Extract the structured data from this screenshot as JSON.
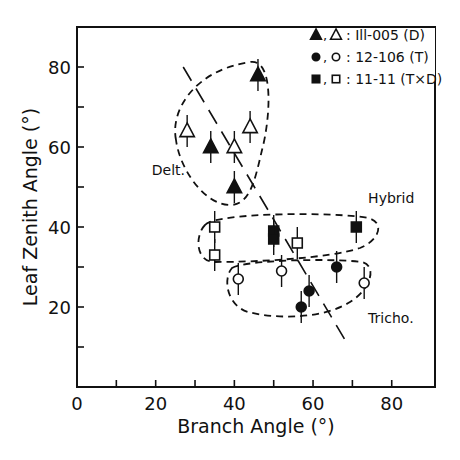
{
  "chart_data": {
    "type": "scatter",
    "title": "",
    "xlabel": "Branch Angle (°)",
    "ylabel": "Leaf Zenith Angle (°)",
    "xlim": [
      0,
      91
    ],
    "ylim": [
      0,
      90
    ],
    "xticks": [
      0,
      10,
      20,
      30,
      40,
      50,
      60,
      70,
      80
    ],
    "xtick_labels": [
      "0",
      "",
      "20",
      "",
      "40",
      "",
      "60",
      "",
      "80"
    ],
    "yticks": [
      10,
      20,
      30,
      40,
      50,
      60,
      70,
      80
    ],
    "ytick_labels": [
      "",
      "20",
      "",
      "40",
      "",
      "60",
      "",
      "80"
    ],
    "grid": false,
    "legend_position": "upper right",
    "legend": [
      {
        "symbols": "▲,△",
        "label": ": Ill-005 (D)",
        "marker": "triangle"
      },
      {
        "symbols": "●,○",
        "label": ": 12-106 (T)",
        "marker": "circle"
      },
      {
        "symbols": "■,□",
        "label": ": 11-11 (T×D)",
        "marker": "square"
      }
    ],
    "series": [
      {
        "name": "Ill-005 (D)",
        "group_label": "Delt.",
        "marker": "triangle",
        "points": [
          {
            "x": 28,
            "y": 64,
            "filled": false,
            "err": 4
          },
          {
            "x": 34,
            "y": 60,
            "filled": true,
            "err": 4
          },
          {
            "x": 40,
            "y": 60,
            "filled": false,
            "err": 4
          },
          {
            "x": 44,
            "y": 65,
            "filled": false,
            "err": 4
          },
          {
            "x": 46,
            "y": 78,
            "filled": true,
            "err": 4
          },
          {
            "x": 40,
            "y": 50,
            "filled": true,
            "err": 4
          }
        ]
      },
      {
        "name": "11-11 (T×D)",
        "group_label": "Hybrid",
        "marker": "square",
        "points": [
          {
            "x": 35,
            "y": 40,
            "filled": false,
            "err": 4
          },
          {
            "x": 35,
            "y": 33,
            "filled": false,
            "err": 4
          },
          {
            "x": 50,
            "y": 39,
            "filled": true,
            "err": 4
          },
          {
            "x": 50,
            "y": 37,
            "filled": true,
            "err": 4
          },
          {
            "x": 56,
            "y": 36,
            "filled": false,
            "err": 4
          },
          {
            "x": 71,
            "y": 40,
            "filled": true,
            "err": 4
          }
        ]
      },
      {
        "name": "12-106 (T)",
        "group_label": "Tricho.",
        "marker": "circle",
        "points": [
          {
            "x": 41,
            "y": 27,
            "filled": false,
            "err": 4
          },
          {
            "x": 52,
            "y": 29,
            "filled": false,
            "err": 4
          },
          {
            "x": 59,
            "y": 24,
            "filled": true,
            "err": 4
          },
          {
            "x": 57,
            "y": 20,
            "filled": true,
            "err": 4
          },
          {
            "x": 66,
            "y": 30,
            "filled": true,
            "err": 4
          },
          {
            "x": 73,
            "y": 26,
            "filled": false,
            "err": 4
          }
        ]
      }
    ],
    "regression_line": {
      "style": "long-dash",
      "x1": 27,
      "y1": 80,
      "x2": 68,
      "y2": 12
    },
    "annotations": [
      {
        "text": "Delt.",
        "x": 19,
        "y": 53
      },
      {
        "text": "Hybrid",
        "x": 74,
        "y": 46
      },
      {
        "text": "Tricho.",
        "x": 74,
        "y": 16
      }
    ]
  }
}
